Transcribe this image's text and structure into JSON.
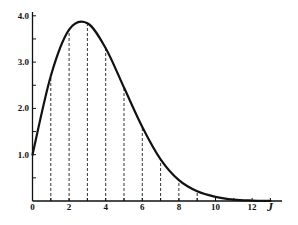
{
  "chart_data": {
    "type": "line",
    "title": "",
    "xlabel": "J",
    "ylabel": "",
    "xlim": [
      0,
      13.5
    ],
    "ylim": [
      0,
      4.1
    ],
    "grid": false,
    "legend": null,
    "x_ticks": [
      0,
      2,
      4,
      6,
      8,
      10,
      12
    ],
    "x_tick_labels": [
      "0",
      "2",
      "4",
      "6",
      "8",
      "10",
      "12"
    ],
    "x_minor_ticks": [
      1,
      2,
      3,
      4,
      5,
      6,
      7,
      8,
      9,
      10,
      11,
      12,
      13
    ],
    "y_ticks": [
      1.0,
      2.0,
      3.0,
      4.0
    ],
    "y_tick_labels": [
      "1.0",
      "2.0",
      "3.0",
      "4.0"
    ],
    "y_minor_ticks": [
      0.5,
      1.5,
      2.5,
      3.5
    ],
    "series": [
      {
        "name": "distribution",
        "x": [
          0,
          1,
          2,
          3,
          4,
          5,
          6,
          7,
          8,
          9,
          10,
          11,
          12,
          13
        ],
        "y": [
          1.0,
          2.7,
          3.7,
          3.84,
          3.3,
          2.45,
          1.6,
          0.9,
          0.45,
          0.21,
          0.09,
          0.03,
          0.01,
          0.003
        ]
      }
    ],
    "drop_lines": {
      "style": "dashed",
      "x": [
        1,
        2,
        3,
        4,
        5,
        6,
        7,
        8,
        9
      ]
    },
    "annotations": {
      "peak_x": 2.65,
      "peak_y": 3.88
    }
  },
  "colors": {
    "curve": "#111111",
    "axes": "#111111",
    "drop_lines": "#333333",
    "background": "#ffffff"
  }
}
